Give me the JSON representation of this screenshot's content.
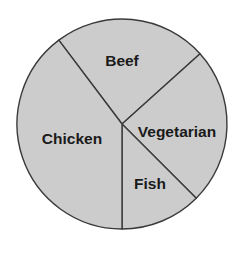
{
  "chart_data": {
    "type": "pie",
    "title": "",
    "subtitle": "",
    "xlabel": "",
    "ylabel": "",
    "legend_position": "none",
    "grid": false,
    "labels_inside_slices": true,
    "categories": [
      "Beef",
      "Vegetarian",
      "Fish",
      "Chicken"
    ],
    "values": [
      23.6,
      24.2,
      12.5,
      39.7
    ],
    "slices": [
      {
        "label": "Beef",
        "value": 23.6,
        "start_angle_deg": -37,
        "end_angle_deg": 48,
        "sweep_deg": 85,
        "fill": "#cccccc",
        "stroke": "#3a3a3a",
        "label_x": 122,
        "label_y": 62
      },
      {
        "label": "Vegetarian",
        "value": 24.2,
        "start_angle_deg": 48,
        "end_angle_deg": 135,
        "sweep_deg": 87,
        "fill": "#cccccc",
        "stroke": "#3a3a3a",
        "label_x": 177,
        "label_y": 133
      },
      {
        "label": "Fish",
        "value": 12.5,
        "start_angle_deg": 135,
        "end_angle_deg": 180,
        "sweep_deg": 45,
        "fill": "#cccccc",
        "stroke": "#3a3a3a",
        "label_x": 150,
        "label_y": 185
      },
      {
        "label": "Chicken",
        "value": 39.7,
        "start_angle_deg": 180,
        "end_angle_deg": 323,
        "sweep_deg": 143,
        "fill": "#cccccc",
        "stroke": "#3a3a3a",
        "label_x": 72,
        "label_y": 140
      }
    ],
    "geometry": {
      "center_x": 122,
      "center_y": 124,
      "radius": 105
    },
    "colors": {
      "background": "#ffffff",
      "slice_fill": "#cccccc",
      "slice_stroke": "#3a3a3a",
      "label_text": "#1a1a1a"
    }
  }
}
